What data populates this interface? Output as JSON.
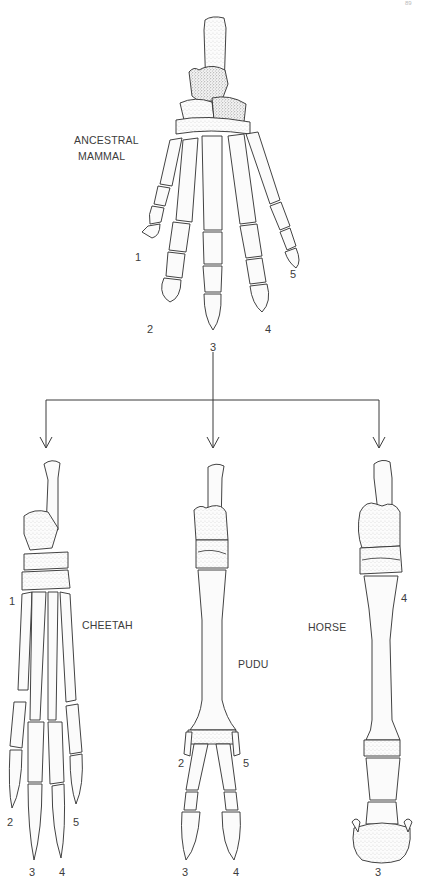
{
  "figure": {
    "page_number": "89",
    "ancestor": {
      "label_line1": "ANCESTRAL",
      "label_line2": "MAMMAL",
      "digits": [
        "1",
        "2",
        "3",
        "4",
        "5"
      ]
    },
    "descendants": [
      {
        "name": "CHEETAH",
        "digits": [
          "1",
          "2",
          "3",
          "4",
          "5"
        ]
      },
      {
        "name": "PUDU",
        "digits": [
          "2",
          "3",
          "4",
          "5"
        ]
      },
      {
        "name": "HORSE",
        "digits": [
          "3",
          "4"
        ]
      }
    ],
    "arrows": {
      "from": "ancestor",
      "to": [
        "cheetah",
        "pudu",
        "horse"
      ]
    },
    "colors": {
      "ink": "#2e2e2e",
      "paper": "#ffffff"
    }
  }
}
